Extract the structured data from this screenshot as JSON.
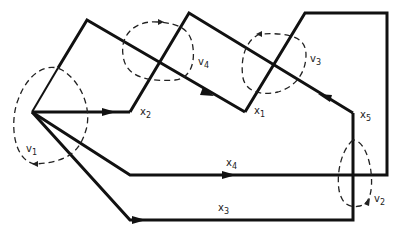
{
  "diagram": {
    "type": "flow graph with loops",
    "colors": {
      "line": "#111111",
      "background": "#ffffff"
    },
    "edge_labels": [
      {
        "id": "x1",
        "text": "x",
        "sub": "1"
      },
      {
        "id": "x2",
        "text": "x",
        "sub": "2"
      },
      {
        "id": "x3",
        "text": "x",
        "sub": "3"
      },
      {
        "id": "x4",
        "text": "x",
        "sub": "4"
      },
      {
        "id": "x5",
        "text": "x",
        "sub": "5"
      }
    ],
    "loop_labels": [
      {
        "id": "v1",
        "text": "v",
        "sub": "1"
      },
      {
        "id": "v2",
        "text": "v",
        "sub": "2"
      },
      {
        "id": "v3",
        "text": "v",
        "sub": "3"
      },
      {
        "id": "v4",
        "text": "v",
        "sub": "4"
      }
    ]
  }
}
